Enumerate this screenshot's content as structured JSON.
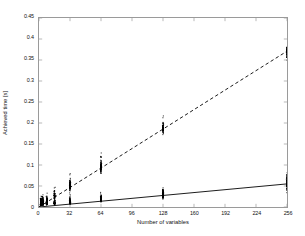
{
  "chart_data": {
    "type": "scatter",
    "title": "",
    "xlabel": "Number of variables",
    "ylabel": "Achieved time [s]",
    "xlim": [
      0,
      256
    ],
    "ylim": [
      0,
      0.45
    ],
    "xticks": [
      0,
      32,
      64,
      96,
      128,
      160,
      192,
      224,
      256
    ],
    "xtick_labels": [
      "0",
      "32",
      "64",
      "96",
      "128",
      "160",
      "192",
      "224",
      "256"
    ],
    "yticks": [
      0,
      0.05,
      0.1,
      0.15,
      0.2,
      0.25,
      0.3,
      0.35,
      0.4,
      0.45
    ],
    "ytick_labels": [
      "0",
      "0.05",
      "0.1",
      "0.15",
      "0.2",
      "0.25",
      "0.3",
      "0.35",
      "0.4",
      "0.45"
    ],
    "grid": false,
    "legend": null,
    "marker": "dot",
    "marker_color": "#000000",
    "series": [
      {
        "name": "upper-series",
        "trend_style": "dashed",
        "trend_color": "#000000",
        "trend_endpoints": [
          [
            0,
            0.0
          ],
          [
            256,
            0.371
          ]
        ],
        "clusters": [
          {
            "x": 2,
            "min": 0.0,
            "max": 0.045,
            "center": 0.01,
            "n": 70
          },
          {
            "x": 4,
            "min": 0.0,
            "max": 0.05,
            "center": 0.012,
            "n": 70
          },
          {
            "x": 8,
            "min": 0.002,
            "max": 0.055,
            "center": 0.015,
            "n": 70
          },
          {
            "x": 16,
            "min": 0.004,
            "max": 0.068,
            "center": 0.026,
            "n": 70
          },
          {
            "x": 32,
            "min": 0.018,
            "max": 0.112,
            "center": 0.05,
            "n": 80
          },
          {
            "x": 64,
            "min": 0.06,
            "max": 0.168,
            "center": 0.094,
            "n": 80
          },
          {
            "x": 128,
            "min": 0.158,
            "max": 0.232,
            "center": 0.186,
            "n": 80
          },
          {
            "x": 256,
            "min": 0.335,
            "max": 0.4,
            "center": 0.368,
            "n": 80
          }
        ]
      },
      {
        "name": "lower-series",
        "trend_style": "solid",
        "trend_color": "#000000",
        "trend_endpoints": [
          [
            0,
            0.0
          ],
          [
            256,
            0.055
          ]
        ],
        "clusters": [
          {
            "x": 2,
            "min": 0.0,
            "max": 0.04,
            "center": 0.006,
            "n": 90
          },
          {
            "x": 4,
            "min": 0.0,
            "max": 0.042,
            "center": 0.007,
            "n": 90
          },
          {
            "x": 8,
            "min": 0.0,
            "max": 0.044,
            "center": 0.008,
            "n": 90
          },
          {
            "x": 16,
            "min": 0.0,
            "max": 0.046,
            "center": 0.01,
            "n": 90
          },
          {
            "x": 32,
            "min": 0.0,
            "max": 0.048,
            "center": 0.012,
            "n": 90
          },
          {
            "x": 64,
            "min": 0.002,
            "max": 0.05,
            "center": 0.018,
            "n": 90
          },
          {
            "x": 128,
            "min": 0.004,
            "max": 0.072,
            "center": 0.03,
            "n": 90
          },
          {
            "x": 256,
            "min": 0.006,
            "max": 0.1,
            "center": 0.055,
            "n": 90
          }
        ]
      }
    ],
    "colors": {
      "background": "#ffffff",
      "axis": "#9a9a9a",
      "text": "#111111",
      "data": "#000000"
    }
  }
}
